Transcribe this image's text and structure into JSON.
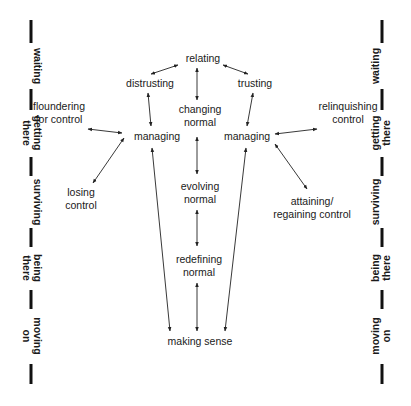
{
  "nodes": {
    "relating": {
      "lines": [
        "relating"
      ]
    },
    "distrusting": {
      "lines": [
        "distrusting"
      ]
    },
    "trusting": {
      "lines": [
        "trusting"
      ]
    },
    "changing_normal": {
      "lines": [
        "changing",
        "normal"
      ]
    },
    "floundering": {
      "lines": [
        "floundering",
        "for control"
      ]
    },
    "relinquishing": {
      "lines": [
        "relinquishing",
        "control"
      ]
    },
    "managing_left": {
      "lines": [
        "managing"
      ]
    },
    "managing_right": {
      "lines": [
        "managing"
      ]
    },
    "losing_control": {
      "lines": [
        "losing",
        "control"
      ]
    },
    "evolving_normal": {
      "lines": [
        "evolving",
        "normal"
      ]
    },
    "attaining": {
      "lines": [
        "attaining/",
        "regaining control"
      ]
    },
    "redefining_normal": {
      "lines": [
        "redefining",
        "normal"
      ]
    },
    "making_sense": {
      "lines": [
        "making sense"
      ]
    }
  },
  "stages": [
    {
      "lines": [
        "waiting"
      ]
    },
    {
      "lines": [
        "getting",
        "there"
      ]
    },
    {
      "lines": [
        "surviving"
      ]
    },
    {
      "lines": [
        "being",
        "there"
      ]
    },
    {
      "lines": [
        "moving",
        "on"
      ]
    }
  ],
  "edges": [
    {
      "from": "relating",
      "to": "distrusting",
      "type": "bidirectional"
    },
    {
      "from": "relating",
      "to": "trusting",
      "type": "bidirectional"
    },
    {
      "from": "relating",
      "to": "changing_normal",
      "type": "bidirectional"
    },
    {
      "from": "distrusting",
      "to": "managing_left",
      "type": "bidirectional"
    },
    {
      "from": "trusting",
      "to": "managing_right",
      "type": "bidirectional"
    },
    {
      "from": "floundering",
      "to": "managing_left",
      "type": "bidirectional"
    },
    {
      "from": "losing_control",
      "to": "managing_left",
      "type": "bidirectional"
    },
    {
      "from": "relinquishing",
      "to": "managing_right",
      "type": "bidirectional"
    },
    {
      "from": "attaining",
      "to": "managing_right",
      "type": "bidirectional"
    },
    {
      "from": "changing_normal",
      "to": "evolving_normal",
      "type": "bidirectional"
    },
    {
      "from": "evolving_normal",
      "to": "redefining_normal",
      "type": "bidirectional"
    },
    {
      "from": "redefining_normal",
      "to": "making_sense",
      "type": "bidirectional"
    },
    {
      "from": "managing_left",
      "to": "making_sense",
      "type": "bidirectional"
    },
    {
      "from": "managing_right",
      "to": "making_sense",
      "type": "bidirectional"
    }
  ]
}
